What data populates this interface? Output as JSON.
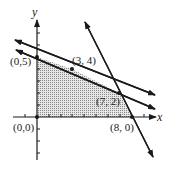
{
  "diagram": {
    "type": "feasible-region-graph",
    "axes": {
      "x_label": "x",
      "y_label": "y"
    },
    "region_color": "#bdbdbd",
    "line_color": "#1a1a1a",
    "vertices": [
      {
        "label": "(0,0)",
        "x": 0,
        "y": 0
      },
      {
        "label": "(0,5)",
        "x": 0,
        "y": 5
      },
      {
        "label": "(3, 4)",
        "x": 3,
        "y": 4
      },
      {
        "label": "(7, 2)",
        "x": 7,
        "y": 2
      },
      {
        "label": "(8, 0)",
        "x": 8,
        "y": 0
      }
    ],
    "lines": [
      {
        "name": "upper-constraint-line",
        "through": [
          [
            0,
            5
          ],
          [
            7,
            2
          ]
        ]
      },
      {
        "name": "middle-constraint-line",
        "through": [
          [
            3,
            4
          ],
          [
            7,
            2
          ]
        ]
      },
      {
        "name": "steep-constraint-line",
        "through": [
          [
            7,
            2
          ],
          [
            8,
            0
          ]
        ]
      }
    ]
  }
}
